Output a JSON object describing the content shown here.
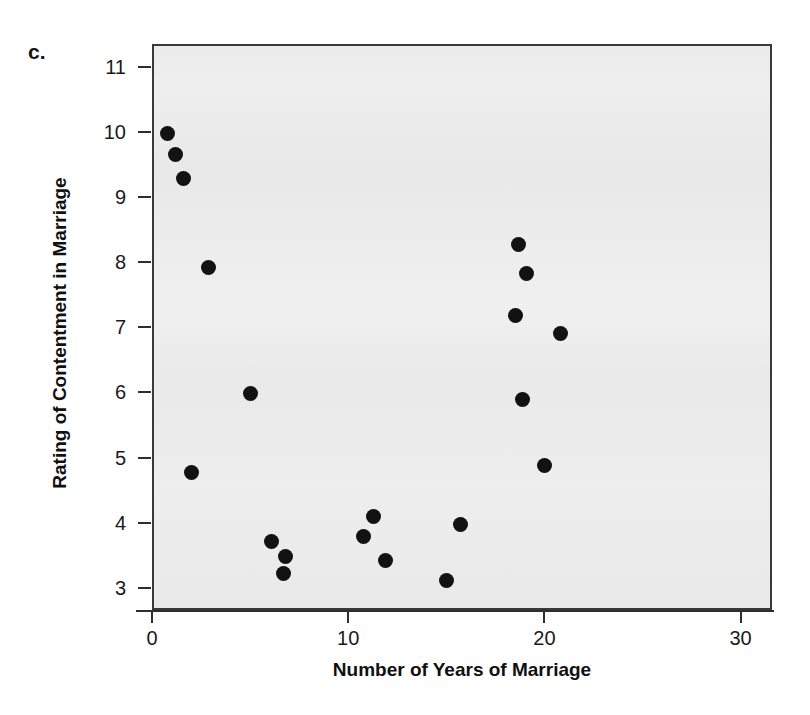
{
  "figure": {
    "panel_letter": "c."
  },
  "chart_data": {
    "type": "scatter",
    "title": "",
    "xlabel": "Number of Years of Marriage",
    "ylabel": "Rating of Contentment in Marriage",
    "xlim": [
      0,
      31.6
    ],
    "ylim": [
      2.66,
      11.35
    ],
    "xticks": [
      0,
      10,
      20,
      30
    ],
    "xtick_labels": [
      "0",
      "10",
      "20",
      "30"
    ],
    "yticks": [
      3,
      4,
      5,
      6,
      7,
      8,
      9,
      10,
      11
    ],
    "ytick_labels": [
      "3",
      "4",
      "5",
      "6",
      "7",
      "8",
      "9",
      "10",
      "11"
    ],
    "grid": false,
    "legend": null,
    "marker": "filled-circle",
    "marker_color": "#121212",
    "plot_background": "#ececec",
    "frame_color": "#3a3a3a",
    "points": [
      {
        "x": 0.7,
        "y": 10.0
      },
      {
        "x": 1.1,
        "y": 9.68
      },
      {
        "x": 1.5,
        "y": 9.32
      },
      {
        "x": 2.8,
        "y": 7.95
      },
      {
        "x": 1.9,
        "y": 4.8
      },
      {
        "x": 4.9,
        "y": 6.02
      },
      {
        "x": 6.0,
        "y": 3.74
      },
      {
        "x": 6.7,
        "y": 3.51
      },
      {
        "x": 6.6,
        "y": 3.25
      },
      {
        "x": 10.7,
        "y": 3.82
      },
      {
        "x": 11.2,
        "y": 4.12
      },
      {
        "x": 11.8,
        "y": 3.45
      },
      {
        "x": 14.9,
        "y": 3.14
      },
      {
        "x": 15.6,
        "y": 4.01
      },
      {
        "x": 18.6,
        "y": 8.31
      },
      {
        "x": 19.0,
        "y": 7.86
      },
      {
        "x": 18.4,
        "y": 7.21
      },
      {
        "x": 20.7,
        "y": 6.93
      },
      {
        "x": 18.8,
        "y": 5.92
      },
      {
        "x": 19.9,
        "y": 4.91
      }
    ]
  }
}
